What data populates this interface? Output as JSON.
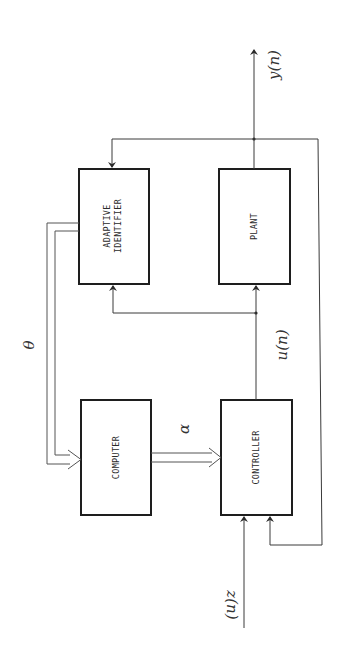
{
  "diagram": {
    "orientation": "rotated 90 degrees counter-clockwise",
    "colors": {
      "line": "#3a3a3a",
      "box_border": "#1e1e1e",
      "background": "#ffffff"
    },
    "blocks": {
      "adaptive_identifier": {
        "line1": "ADAPTIVE",
        "line2": "IDENTIFIER"
      },
      "plant": {
        "label": "PLANT"
      },
      "computer": {
        "label": "COMPUTER"
      },
      "controller": {
        "label": "CONTROLLER"
      }
    },
    "signals": {
      "output": "y(n)",
      "control": "u(n)",
      "reference": "z(n)",
      "parameters": "θ",
      "controller_params": "α"
    }
  }
}
